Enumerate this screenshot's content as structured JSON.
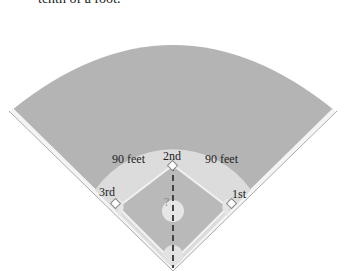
{
  "caption": "tenth of a foot.",
  "diagram": {
    "bases": {
      "second": "2nd",
      "first": "1st",
      "third": "3rd"
    },
    "side_labels": {
      "left": "90 feet",
      "right": "90 feet"
    },
    "unknown_label": "?",
    "colors": {
      "outfield": "#b4b4b4",
      "infield_dirt": "#dcdcdc",
      "infield_grass": "#b9b9b9",
      "foul_line": "#ffffff",
      "dashed_line": "#444444"
    }
  }
}
